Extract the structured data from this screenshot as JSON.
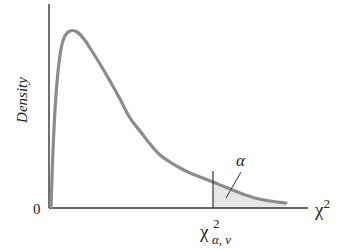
{
  "chart_data": {
    "type": "line",
    "title": "",
    "xlabel": "χ²",
    "ylabel": "Density",
    "origin_label": "0",
    "distribution": "chi-square probability density",
    "series": [
      {
        "name": "chi-square density",
        "color": "#8c8c8c",
        "points_px": [
          [
            51,
            207
          ],
          [
            53,
            150
          ],
          [
            56,
            95
          ],
          [
            60,
            55
          ],
          [
            64,
            38
          ],
          [
            70,
            31
          ],
          [
            77,
            32
          ],
          [
            84,
            39
          ],
          [
            90,
            48
          ],
          [
            100,
            64
          ],
          [
            110,
            81
          ],
          [
            120,
            99
          ],
          [
            130,
            118
          ],
          [
            140,
            131
          ],
          [
            150,
            144
          ],
          [
            160,
            155
          ],
          [
            170,
            162
          ],
          [
            180,
            168
          ],
          [
            190,
            173
          ],
          [
            200,
            177
          ],
          [
            213,
            182
          ],
          [
            225,
            187
          ],
          [
            240,
            193
          ],
          [
            255,
            198
          ],
          [
            270,
            201
          ],
          [
            286,
            203
          ]
        ]
      }
    ],
    "critical_value": {
      "label_base": "χ",
      "label_sup": "2",
      "label_sub": "α, ν",
      "x_px": 213
    },
    "shaded_region": {
      "label": "α",
      "meaning": "upper tail area beyond critical value",
      "fill": "#e6e6e6"
    },
    "grid": false,
    "axes": {
      "color": "#333333"
    }
  }
}
